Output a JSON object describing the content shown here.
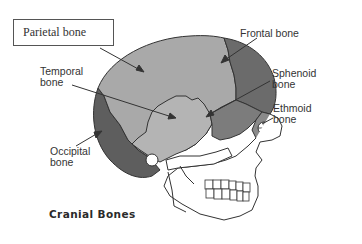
{
  "diagram": {
    "title": "Cranial Bones",
    "labels": [
      {
        "id": "parietal",
        "text": "Parietal bone",
        "boxed": true
      },
      {
        "id": "frontal",
        "text": "Frontal bone",
        "boxed": false
      },
      {
        "id": "temporal",
        "text": "Temporal\nbone",
        "boxed": false
      },
      {
        "id": "sphenoid",
        "text": "Sphenoid\nbone",
        "boxed": false
      },
      {
        "id": "ethmoid",
        "text": "Ethmoid\nbone",
        "boxed": false
      },
      {
        "id": "occipital",
        "text": "Occipital\nbone",
        "boxed": false
      }
    ],
    "colors": {
      "parietal": "#a9a9a9",
      "temporal": "#b4b4b4",
      "frontal": "#6b6b6b",
      "occipital": "#5e5e5e",
      "sphenoid": "#7c7c7c",
      "ethmoid": "#8a8a8a",
      "facial": "#ffffff",
      "outline": "#333333"
    }
  }
}
